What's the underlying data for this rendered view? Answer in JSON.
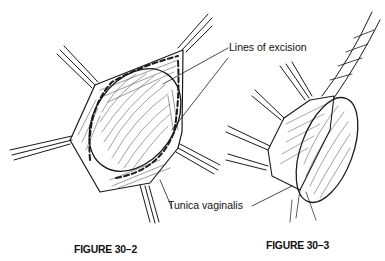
{
  "figures": [
    {
      "id": "fig-30-2",
      "caption": "FIGURE 30–2",
      "labels": {
        "excision": "Lines of excision",
        "tunica": "Tunica vaginalis"
      }
    },
    {
      "id": "fig-30-3",
      "caption": "FIGURE 30–3"
    }
  ],
  "colors": {
    "ink": "#111111",
    "background": "#ffffff"
  }
}
